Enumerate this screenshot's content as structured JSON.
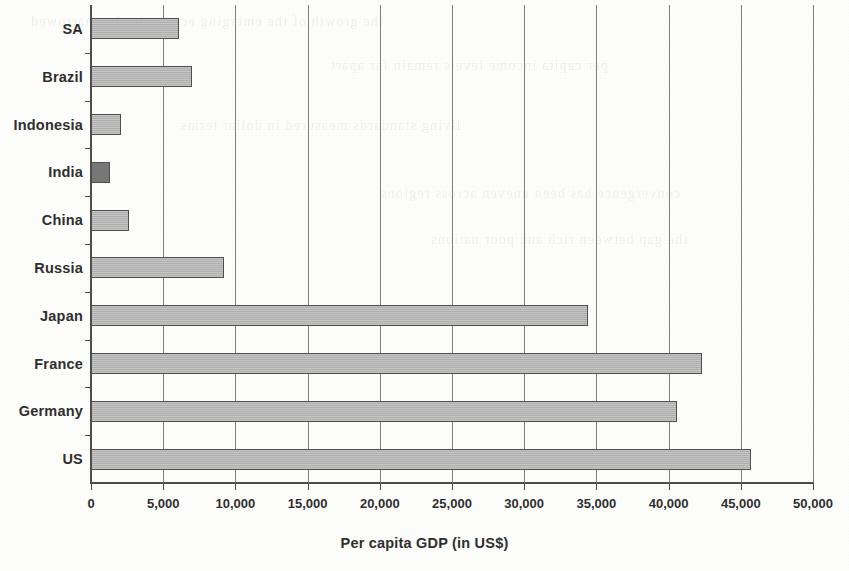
{
  "chart_data": {
    "type": "bar",
    "orientation": "horizontal",
    "title": "",
    "xlabel": "Per capita GDP (in US$)",
    "ylabel": "",
    "categories": [
      "SA",
      "Brazil",
      "Indonesia",
      "India",
      "China",
      "Russia",
      "Japan",
      "France",
      "Germany",
      "US"
    ],
    "values": [
      6100,
      7000,
      2100,
      1300,
      2600,
      9200,
      34400,
      42300,
      40600,
      45700
    ],
    "xlim": [
      0,
      50000
    ],
    "xticks": [
      0,
      5000,
      10000,
      15000,
      20000,
      25000,
      30000,
      35000,
      40000,
      45000,
      50000
    ],
    "xtick_labels": [
      "0",
      "5,000",
      "10,000",
      "15,000",
      "20,000",
      "25,000",
      "30,000",
      "35,000",
      "40,000",
      "45,000",
      "50,000"
    ],
    "grid": "vertical",
    "legend": "none",
    "bar_color": "#b7b7b7",
    "bar_edge_color": "#4f4f4f",
    "highlight_category": "India",
    "highlight_color": "#787878",
    "axis_color": "#4c4c4c",
    "gridline_color": "#7d7f82",
    "background_color": "#fdfdfc"
  },
  "ghost_text": {
    "lines": [
      "the growth of the emerging economies has narrowed",
      "per capita income levels remain far apart",
      "living standards measured in dollar terms",
      "convergence has been uneven across regions",
      "the gap between rich and poor nations"
    ]
  }
}
